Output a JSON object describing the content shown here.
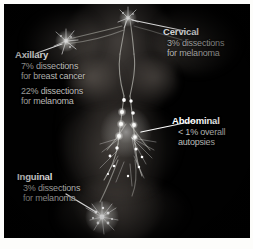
{
  "figure": {
    "body_outline": "female torso, frontal view, dark photographic plate",
    "background_color": "#010101",
    "page_color": "#fdfdfb",
    "heading_color": "#ffffff",
    "body_text_color": "#bdbdba",
    "leader_line_color": "#ffffff",
    "node_highlight_color": "#ffffff"
  },
  "annotations": [
    {
      "id": "cervical",
      "title": "Cervical",
      "lines": [
        "3% dissections",
        "for melanoma"
      ]
    },
    {
      "id": "axillary",
      "title": "Axillary",
      "lines": [
        "7% dissections",
        "for breast cancer",
        "22% dissections",
        "for melanoma"
      ]
    },
    {
      "id": "abdominal",
      "title": "Abdominal",
      "lines": [
        "< 1% overall",
        "autopsies"
      ]
    },
    {
      "id": "inguinal",
      "title": "Inguinal",
      "lines": [
        "3% dissections",
        "for melanoma"
      ]
    }
  ]
}
